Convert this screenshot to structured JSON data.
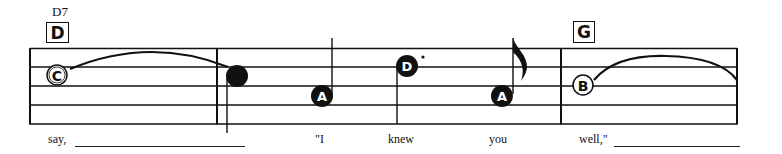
{
  "chords": [
    {
      "id": "d7",
      "label": "D7",
      "box_label": "D"
    },
    {
      "id": "g",
      "label": "",
      "box_label": "G"
    }
  ],
  "staff": {
    "lines": 5,
    "color": "#111111"
  },
  "notes": [
    {
      "letter": "C",
      "style": "hollow",
      "measure": 1
    },
    {
      "letter": "",
      "style": "filled",
      "measure": 2,
      "tied_from_previous": true
    },
    {
      "letter": "A",
      "style": "filled",
      "measure": 2
    },
    {
      "letter": "D",
      "style": "filled",
      "measure": 2,
      "dotted": true
    },
    {
      "letter": "A",
      "style": "filled",
      "measure": 2,
      "flag": "eighth"
    },
    {
      "letter": "B",
      "style": "hollow",
      "measure": 3,
      "tied": true
    }
  ],
  "lyrics": {
    "w1": "say,",
    "w2": "\"I",
    "w3": "knew",
    "w4": "you",
    "w5": "well,\""
  }
}
